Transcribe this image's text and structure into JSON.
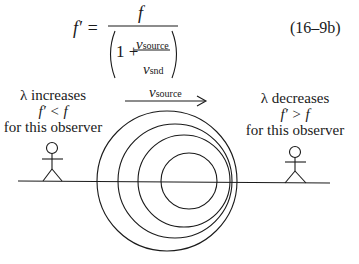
{
  "equation": {
    "lhs": "f′ =",
    "numerator": "f",
    "one_plus": "1 +",
    "inner_num_var": "v",
    "inner_num_sub": "source",
    "inner_den_var": "v",
    "inner_den_sub": "snd",
    "number": "(16–9b)"
  },
  "velocity_label": {
    "var": "v",
    "sub": "source"
  },
  "left_observer": {
    "line1": "λ increases",
    "line2": "f′ < f",
    "line3": "for this observer"
  },
  "right_observer": {
    "line1": "λ decreases",
    "line2": "f′ > f",
    "line3": "for this observer"
  },
  "colors": {
    "ink": "#1a1a1a",
    "background": "#ffffff"
  }
}
